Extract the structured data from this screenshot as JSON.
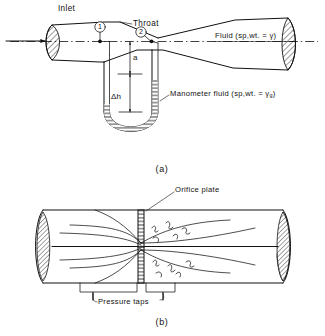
{
  "figure": {
    "title_a_caption": "(a)",
    "title_b_caption": "(b)"
  },
  "venturi": {
    "labels": {
      "inlet": "Inlet",
      "throat": "Throat",
      "fluid": "Fluid (sp,wt. = γ)",
      "manometer_fluid": "Manometer fluid (sp,wt. = γ",
      "manometer_fluid_sub": "g",
      "manometer_fluid_close": ")",
      "point_1": "1",
      "point_2": "2",
      "dim_a": "a",
      "dim_delta_h": "Δh"
    }
  },
  "orifice": {
    "labels": {
      "orifice_plate": "Orifice plate",
      "pressure_taps": "Pressure taps"
    }
  },
  "colors": {
    "ink": "#111111",
    "paper": "#ffffff"
  }
}
